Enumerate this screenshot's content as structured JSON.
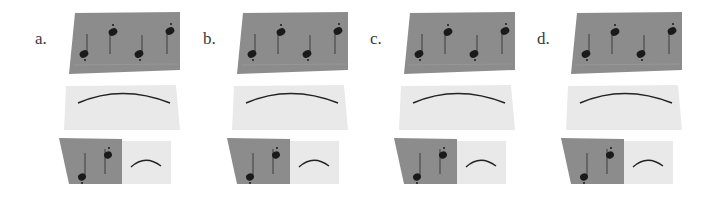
{
  "figure": {
    "panels": [
      {
        "id": "a",
        "label": "a.",
        "left": 35
      },
      {
        "id": "b",
        "label": "b.",
        "left": 203
      },
      {
        "id": "c",
        "label": "c.",
        "left": 370
      },
      {
        "id": "d",
        "label": "d.",
        "left": 537
      }
    ],
    "colors": {
      "dark_card": "#8c8c8c",
      "light_card": "#e9e9e9",
      "note": "#1a1a1a",
      "stem": "#3c3c3c",
      "arc": "#222222",
      "label": "#3a3a3a"
    }
  }
}
